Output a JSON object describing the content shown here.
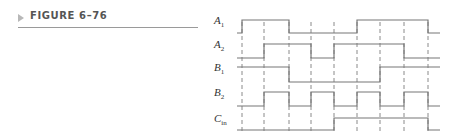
{
  "figure": {
    "title": "FIGURE 6–76",
    "arrow_color": "#b8b8b8",
    "title_color": "#555555"
  },
  "signals": [
    {
      "name": "A",
      "sub": "1",
      "high_y": 20,
      "low_y": 33,
      "segments": [
        [
          "L",
          237,
          242
        ],
        [
          "H",
          242,
          289
        ],
        [
          "L",
          289,
          357
        ],
        [
          "H",
          357,
          428
        ],
        [
          "L",
          428,
          440
        ]
      ]
    },
    {
      "name": "A",
      "sub": "2",
      "high_y": 44,
      "low_y": 58,
      "segments": [
        [
          "L",
          237,
          264
        ],
        [
          "H",
          264,
          311
        ],
        [
          "L",
          311,
          334
        ],
        [
          "H",
          334,
          404
        ],
        [
          "L",
          404,
          440
        ]
      ]
    },
    {
      "name": "B",
      "sub": "1",
      "high_y": 67,
      "low_y": 82,
      "segments": [
        [
          "H",
          237,
          289
        ],
        [
          "L",
          289,
          380
        ],
        [
          "H",
          380,
          440
        ]
      ]
    },
    {
      "name": "B",
      "sub": "2",
      "high_y": 92,
      "low_y": 106,
      "segments": [
        [
          "L",
          237,
          264
        ],
        [
          "H",
          264,
          289
        ],
        [
          "L",
          289,
          311
        ],
        [
          "H",
          311,
          334
        ],
        [
          "L",
          334,
          357
        ],
        [
          "H",
          357,
          380
        ],
        [
          "L",
          380,
          404
        ],
        [
          "H",
          404,
          428
        ],
        [
          "L",
          428,
          440
        ]
      ]
    },
    {
      "name": "C",
      "sub": "in",
      "high_y": 118,
      "low_y": 130,
      "segments": [
        [
          "L",
          237,
          334
        ],
        [
          "H",
          334,
          428
        ],
        [
          "L",
          428,
          440
        ]
      ]
    }
  ],
  "timing_marks_x": [
    242,
    264,
    289,
    311,
    334,
    357,
    380,
    404,
    428
  ],
  "dashed_range": {
    "y1": 22,
    "y2": 134
  },
  "line_color": "#777777",
  "dash_color": "#8a8a8a"
}
